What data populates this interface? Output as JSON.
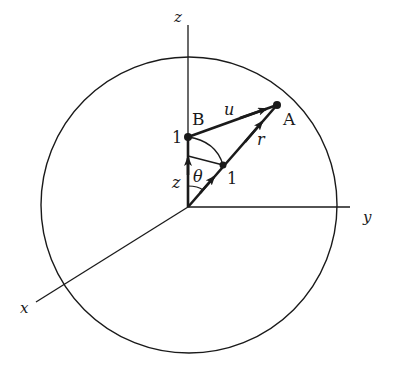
{
  "diagram": {
    "type": "vector-geometry-sphere",
    "colors": {
      "ink": "#1a1a1a",
      "background": "#ffffff"
    },
    "axes": {
      "z_label": "z",
      "y_label": "y",
      "x_label": "x"
    },
    "points": {
      "A_label": "A",
      "B_label": "B",
      "B_unit_label": "1",
      "r_unit_label": "1"
    },
    "vectors": {
      "u_label": "u",
      "r_label": "r",
      "z_label": "z"
    },
    "angle": {
      "theta_label": "θ"
    }
  }
}
